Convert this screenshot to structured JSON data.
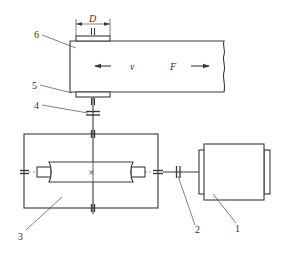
{
  "diagram": {
    "symbols": {
      "drum_diameter": "D",
      "belt_speed": "v",
      "belt_force": "F"
    },
    "part_labels": [
      {
        "id": "1",
        "text": "1",
        "part": "electric-motor"
      },
      {
        "id": "2",
        "text": "2",
        "part": "motor-coupling"
      },
      {
        "id": "3",
        "text": "3",
        "part": "gear-reducer"
      },
      {
        "id": "4",
        "text": "4",
        "part": "output-coupling"
      },
      {
        "id": "5",
        "text": "5",
        "part": "drum"
      },
      {
        "id": "6",
        "text": "6",
        "part": "conveyor-belt"
      }
    ],
    "gear_mark": "×",
    "colors": {
      "line": "#3a3a3a",
      "background": "#ffffff"
    }
  }
}
